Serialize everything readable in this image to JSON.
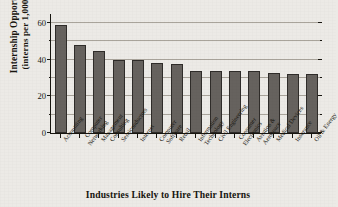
{
  "chart_data": {
    "type": "bar",
    "title": "",
    "xlabel": "Industries Likely to Hire Their Interns",
    "ylabel_line1": "Internship Opportunities",
    "ylabel_line2": "(interns per 1,000 hires)",
    "ylim": [
      0,
      65
    ],
    "ytick_labels": [
      "0",
      "20",
      "40",
      "60"
    ],
    "ytick_values": [
      0,
      20,
      40,
      60
    ],
    "yminor_values": [
      10,
      30,
      50
    ],
    "grid": "horizontal-major-and-minor",
    "legend": "none",
    "bar_color": "#66625e",
    "bar_edge_color": "#2f2c29",
    "categories": [
      "Accounting",
      "Computer Networking",
      "Management Consulting",
      "Semiconductors",
      "Internet",
      "Computer Software",
      "Retail",
      "Information Technology",
      "Civil Engineering",
      "Consumer Electronics",
      "Aviation & Aerospace",
      "Medical Devices",
      "Insurance",
      "Oil & Energy"
    ],
    "category_lines": [
      [
        "Accounting"
      ],
      [
        "Computer",
        "Networking"
      ],
      [
        "Management",
        "Consulting"
      ],
      [
        "Semiconductors"
      ],
      [
        "Internet"
      ],
      [
        "Computer",
        "Software"
      ],
      [
        "Retail"
      ],
      [
        "Information",
        "Technology"
      ],
      [
        "Civil Engineering"
      ],
      [
        "Consumer",
        "Electronics"
      ],
      [
        "Aviation &",
        "Aerospace"
      ],
      [
        "Medical Devices"
      ],
      [
        "Insurance"
      ],
      [
        "Oil & Energy"
      ]
    ],
    "values": [
      59,
      48,
      45,
      40,
      40,
      38,
      37.5,
      34,
      34,
      34,
      34,
      33,
      32,
      32
    ]
  }
}
